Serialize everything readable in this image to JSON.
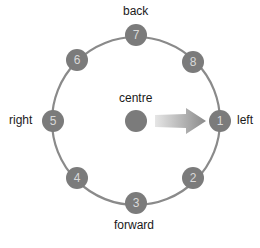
{
  "diagram": {
    "ring": {
      "cx": 136,
      "cy": 121,
      "r": 84,
      "color": "#8a8a8a"
    },
    "node_color": "#7b7b7b",
    "nodes": [
      {
        "label": "1",
        "x": 220,
        "y": 121
      },
      {
        "label": "2",
        "x": 193,
        "y": 178
      },
      {
        "label": "3",
        "x": 136,
        "y": 203
      },
      {
        "label": "4",
        "x": 77,
        "y": 178
      },
      {
        "label": "5",
        "x": 53,
        "y": 121
      },
      {
        "label": "6",
        "x": 77,
        "y": 60
      },
      {
        "label": "7",
        "x": 136,
        "y": 35
      },
      {
        "label": "8",
        "x": 193,
        "y": 62
      }
    ],
    "centre": {
      "label": "centre",
      "x": 136,
      "y": 121
    },
    "arrow": {
      "from": "centre",
      "to": "1",
      "color": "#8c8c8c"
    },
    "directions": {
      "back": "back",
      "forward": "forward",
      "left": "left",
      "right": "right"
    }
  }
}
